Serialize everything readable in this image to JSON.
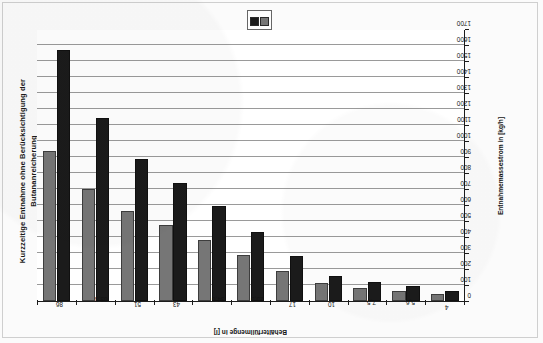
{
  "chart_data": {
    "type": "bar",
    "orientation": "horizontal-rotated",
    "title": "Kurzzeitige Entnahme ohne Berücksichtigung der Butananreicherung",
    "title_line1": "Kurzzeitige Entnahme ohne Berücksichtigung der",
    "title_line2": "Butananreicherung",
    "xlabel": "Behälterfüllmenge in [l]",
    "ylabel": "Entnahmemassestrom in [kg/h]",
    "categories": [
      "86",
      "63,8",
      "51",
      "43",
      "34,6",
      "25,5",
      "17",
      "10",
      "7,5",
      "5,6",
      "4"
    ],
    "series": [
      {
        "name": "Serie 1",
        "color": "#1b1b1b",
        "values": [
          1570,
          1145,
          890,
          740,
          595,
          430,
          280,
          155,
          120,
          95,
          60
        ]
      },
      {
        "name": "Serie 2",
        "color": "#767676",
        "values": [
          940,
          700,
          565,
          475,
          380,
          285,
          190,
          110,
          80,
          65,
          45
        ]
      }
    ],
    "ylim": [
      0,
      1700
    ],
    "ytick_labels": [
      "1700",
      "1600",
      "1500",
      "1400",
      "1300",
      "1200",
      "1100",
      "1000",
      "900",
      "800",
      "700",
      "600",
      "500",
      "400",
      "300",
      "200",
      "100",
      "0"
    ],
    "ytick_values": [
      1700,
      1600,
      1500,
      1400,
      1300,
      1200,
      1100,
      1000,
      900,
      800,
      700,
      600,
      500,
      400,
      300,
      200,
      100,
      0
    ],
    "grid": true,
    "legend_position": "top-center"
  },
  "legend": {
    "entries": [
      {
        "label": "",
        "color": "#1b1b1b",
        "swatch": "legend-swatch-series-1"
      },
      {
        "label": "",
        "color": "#767676",
        "swatch": "legend-swatch-series-2"
      }
    ]
  },
  "colors": {
    "series_1": "#1b1b1b",
    "series_2": "#767676",
    "axis": "#1c1c1c",
    "grid": "#9a9a9a",
    "background": "#ffffff"
  }
}
